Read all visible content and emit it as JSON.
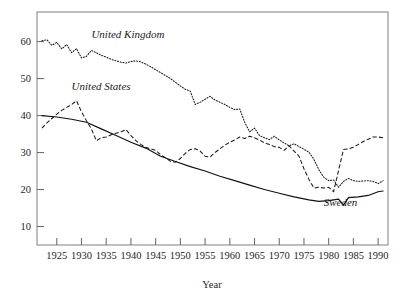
{
  "chart_data": {
    "type": "line",
    "title": "",
    "xlabel": "Year",
    "ylabel": "",
    "xlim": [
      1921,
      1992
    ],
    "ylim": [
      5,
      68
    ],
    "grid": false,
    "legend": "inline-labels",
    "xticks": [
      1925,
      1930,
      1935,
      1940,
      1945,
      1950,
      1955,
      1960,
      1965,
      1970,
      1975,
      1980,
      1985,
      1990
    ],
    "yticks": [
      10,
      20,
      30,
      40,
      50,
      60
    ],
    "annotations": [
      {
        "text": "United Kingdom",
        "x": 1932,
        "y": 61,
        "style": "italic"
      },
      {
        "text": "United States",
        "x": 1928,
        "y": 47,
        "style": "italic"
      },
      {
        "text": "Sweden",
        "x": 1979,
        "y": 15.6,
        "style": "italic"
      }
    ],
    "series": [
      {
        "name": "United Kingdom",
        "linestyle": "dotted",
        "x": [
          1922,
          1923,
          1924,
          1925,
          1926,
          1927,
          1928,
          1929,
          1930,
          1931,
          1932,
          1933,
          1934,
          1935,
          1936,
          1937,
          1938,
          1939,
          1940,
          1941,
          1942,
          1943,
          1944,
          1945,
          1946,
          1947,
          1948,
          1949,
          1950,
          1951,
          1952,
          1953,
          1954,
          1955,
          1956,
          1957,
          1958,
          1959,
          1960,
          1961,
          1962,
          1963,
          1964,
          1965,
          1966,
          1967,
          1968,
          1969,
          1970,
          1971,
          1972,
          1973,
          1974,
          1975,
          1976,
          1977,
          1978,
          1979,
          1980,
          1981,
          1982,
          1983,
          1984,
          1985,
          1986,
          1987,
          1988,
          1989,
          1990,
          1991
        ],
        "y": [
          60.2,
          60.5,
          59.0,
          59.8,
          58.0,
          59.2,
          57.0,
          58.1,
          55.6,
          56.0,
          57.6,
          57.0,
          56.3,
          55.8,
          55.2,
          54.8,
          54.4,
          54.2,
          54.6,
          54.8,
          54.5,
          53.9,
          53.2,
          52.4,
          51.6,
          50.8,
          50.0,
          49.0,
          48.0,
          47.1,
          46.6,
          43.0,
          43.6,
          44.4,
          45.2,
          44.2,
          43.6,
          43.0,
          42.2,
          41.6,
          41.8,
          38.2,
          35.6,
          36.6,
          34.6,
          34.0,
          33.5,
          34.4,
          33.4,
          32.6,
          31.8,
          32.4,
          31.6,
          30.9,
          30.1,
          28.2,
          25.4,
          23.3,
          22.4,
          22.6,
          20.6,
          22.2,
          23.0,
          22.4,
          22.2,
          22.3,
          22.4,
          22.2,
          21.6,
          22.4
        ]
      },
      {
        "name": "United States",
        "linestyle": "dashed",
        "x": [
          1922,
          1923,
          1924,
          1925,
          1926,
          1927,
          1928,
          1929,
          1930,
          1931,
          1932,
          1933,
          1934,
          1935,
          1936,
          1937,
          1938,
          1939,
          1940,
          1941,
          1942,
          1943,
          1944,
          1945,
          1946,
          1947,
          1948,
          1949,
          1950,
          1951,
          1952,
          1953,
          1954,
          1955,
          1956,
          1957,
          1958,
          1959,
          1960,
          1961,
          1962,
          1963,
          1964,
          1965,
          1966,
          1967,
          1968,
          1969,
          1970,
          1971,
          1972,
          1973,
          1974,
          1975,
          1976,
          1977,
          1978,
          1979,
          1980,
          1981,
          1982,
          1983,
          1984,
          1985,
          1986,
          1987,
          1988,
          1989,
          1990,
          1991
        ],
        "y": [
          36.6,
          38.0,
          39.2,
          40.4,
          41.4,
          42.2,
          43.0,
          44.0,
          41.0,
          38.6,
          36.4,
          33.2,
          34.0,
          34.2,
          34.8,
          35.2,
          35.6,
          36.2,
          34.6,
          33.2,
          32.2,
          31.4,
          31.0,
          30.6,
          29.4,
          28.6,
          27.6,
          27.4,
          28.4,
          29.8,
          30.8,
          31.0,
          30.4,
          29.0,
          28.8,
          30.0,
          31.0,
          32.0,
          32.8,
          33.4,
          34.2,
          33.8,
          34.4,
          34.0,
          33.4,
          32.6,
          32.2,
          31.6,
          31.4,
          30.6,
          31.8,
          30.4,
          29.0,
          25.6,
          22.8,
          20.4,
          20.6,
          20.4,
          20.6,
          19.4,
          25.2,
          30.8,
          31.0,
          31.4,
          32.2,
          33.0,
          33.6,
          34.2,
          34.2,
          34.0
        ]
      },
      {
        "name": "Sweden",
        "linestyle": "solid",
        "x": [
          1922,
          1925,
          1928,
          1931,
          1934,
          1937,
          1940,
          1943,
          1946,
          1949,
          1952,
          1955,
          1958,
          1961,
          1964,
          1967,
          1970,
          1973,
          1976,
          1978,
          1980,
          1982,
          1983,
          1984,
          1986,
          1988,
          1990,
          1991
        ],
        "y": [
          40.0,
          39.6,
          39.0,
          38.2,
          36.4,
          34.6,
          32.8,
          31.2,
          29.0,
          27.6,
          26.2,
          25.0,
          23.6,
          22.4,
          21.2,
          20.0,
          19.0,
          18.0,
          17.2,
          16.8,
          17.0,
          17.4,
          15.8,
          17.8,
          18.0,
          18.4,
          19.4,
          19.6
        ]
      }
    ]
  }
}
